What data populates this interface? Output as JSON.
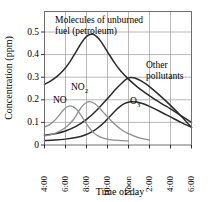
{
  "chart_data": {
    "type": "line",
    "title": "",
    "xlabel": "Time of day",
    "ylabel": "Concentration (ppm)",
    "ylim": [
      0,
      0.59
    ],
    "yticks": [
      0,
      0.1,
      0.2,
      0.3,
      0.4,
      0.5
    ],
    "ytick_labels": [
      "0",
      "0.1",
      "0.2",
      "0.3",
      "0.4",
      "0.5"
    ],
    "xlim": [
      4,
      18
    ],
    "xticks": [
      4,
      6,
      8,
      10,
      12,
      14,
      16,
      18
    ],
    "xtick_labels": [
      "4:00",
      "6:00",
      "8:00",
      "10:00",
      "Noon",
      "2:00",
      "4:00",
      "6:00"
    ],
    "grid": true,
    "legend_position": "inline-annotations",
    "series": [
      {
        "name": "Molecules of unburned fuel (petroleum)",
        "color": "#2a2a2a",
        "style": "dark",
        "x": [
          4.0,
          4.6,
          5.2,
          5.8,
          6.4,
          7.0,
          7.4,
          7.8,
          8.2,
          8.6,
          9.0,
          9.4,
          10.0,
          10.6,
          11.2,
          12.0,
          12.8,
          13.6,
          14.4,
          15.2,
          16.0,
          17.0,
          18.0
        ],
        "y": [
          0.268,
          0.283,
          0.303,
          0.33,
          0.366,
          0.412,
          0.443,
          0.47,
          0.486,
          0.489,
          0.478,
          0.456,
          0.412,
          0.368,
          0.33,
          0.291,
          0.258,
          0.23,
          0.205,
          0.182,
          0.16,
          0.13,
          0.1
        ]
      },
      {
        "name": "Other pollutants",
        "color": "#2a2a2a",
        "style": "dark",
        "x": [
          4.0,
          5.0,
          6.0,
          7.0,
          8.0,
          9.0,
          10.0,
          10.8,
          11.4,
          11.8,
          12.2,
          12.6,
          13.2,
          14.0,
          15.0,
          16.0,
          17.0,
          18.0
        ],
        "y": [
          0.043,
          0.05,
          0.062,
          0.082,
          0.113,
          0.155,
          0.205,
          0.247,
          0.275,
          0.291,
          0.298,
          0.296,
          0.283,
          0.258,
          0.218,
          0.175,
          0.128,
          0.078
        ]
      },
      {
        "name": "O3",
        "color": "#2a2a2a",
        "style": "dark",
        "x": [
          4.0,
          5.0,
          6.0,
          7.0,
          7.8,
          8.6,
          9.2,
          9.8,
          10.4,
          11.0,
          11.6,
          12.2,
          12.8,
          13.4,
          14.2,
          15.0,
          16.0,
          17.0,
          18.0
        ],
        "y": [
          0.02,
          0.022,
          0.026,
          0.033,
          0.043,
          0.06,
          0.08,
          0.105,
          0.135,
          0.163,
          0.183,
          0.191,
          0.19,
          0.182,
          0.166,
          0.148,
          0.124,
          0.1,
          0.078
        ]
      },
      {
        "name": "NO",
        "color": "#8e8e8e",
        "style": "gray",
        "x": [
          4.0,
          4.5,
          5.0,
          5.4,
          5.8,
          6.2,
          6.6,
          7.0,
          7.4,
          7.8,
          8.2,
          8.6,
          9.0,
          9.6,
          10.2,
          11.0,
          12.0
        ],
        "y": [
          0.08,
          0.09,
          0.11,
          0.132,
          0.155,
          0.17,
          0.172,
          0.16,
          0.136,
          0.108,
          0.08,
          0.058,
          0.043,
          0.03,
          0.024,
          0.02,
          0.018
        ]
      },
      {
        "name": "NO2",
        "color": "#8e8e8e",
        "style": "gray",
        "x": [
          4.0,
          4.8,
          5.6,
          6.2,
          6.8,
          7.2,
          7.6,
          8.0,
          8.4,
          8.8,
          9.2,
          9.8,
          10.4,
          11.2,
          12.0,
          13.0,
          14.0
        ],
        "y": [
          0.04,
          0.048,
          0.065,
          0.085,
          0.115,
          0.145,
          0.172,
          0.188,
          0.191,
          0.182,
          0.165,
          0.135,
          0.105,
          0.072,
          0.05,
          0.032,
          0.022
        ]
      }
    ],
    "annotations": [
      {
        "id": "hydrocarbons",
        "line1": "Molecules of unburned",
        "line2": "fuel (petroleum)"
      },
      {
        "id": "other-pollutants",
        "line1": "Other",
        "line2": "pollutants"
      },
      {
        "id": "no2",
        "base": "NO",
        "sub": "2"
      },
      {
        "id": "no",
        "base": "NO",
        "sub": ""
      },
      {
        "id": "o3",
        "base": "O",
        "sub": "3"
      }
    ]
  }
}
